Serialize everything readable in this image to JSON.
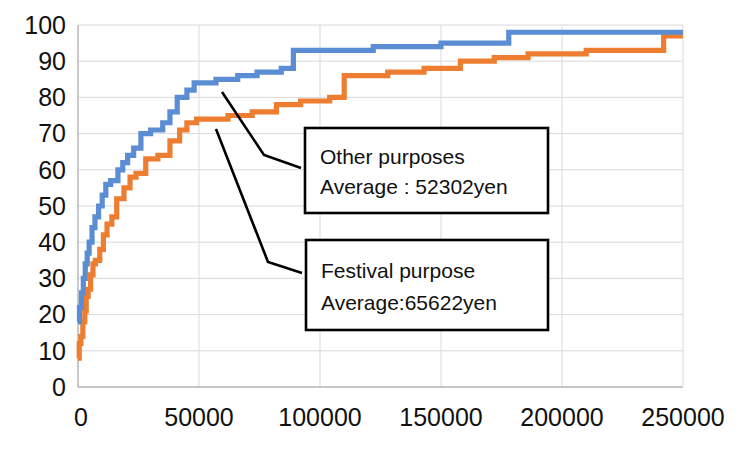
{
  "chart_data": {
    "type": "line",
    "title": "",
    "subtitle": "",
    "xlabel": "",
    "ylabel": "",
    "xlim": [
      0,
      250000
    ],
    "ylim": [
      0,
      100
    ],
    "grid": true,
    "legend_position": "none",
    "x_ticks": [
      "0",
      "50000",
      "100000",
      "150000",
      "200000",
      "250000"
    ],
    "x_tick_values": [
      0,
      50000,
      100000,
      150000,
      200000,
      250000
    ],
    "y_ticks": [
      "0",
      "10",
      "20",
      "30",
      "40",
      "50",
      "60",
      "70",
      "80",
      "90",
      "100"
    ],
    "y_tick_values": [
      0,
      10,
      20,
      30,
      40,
      50,
      60,
      70,
      80,
      90,
      100
    ],
    "series": [
      {
        "name": "Other purposes",
        "color": "#5B8DD4",
        "step": true,
        "points": [
          [
            0,
            18
          ],
          [
            600,
            18
          ],
          [
            600,
            22
          ],
          [
            1400,
            22
          ],
          [
            1400,
            26
          ],
          [
            2200,
            26
          ],
          [
            2200,
            30
          ],
          [
            3000,
            30
          ],
          [
            3000,
            34
          ],
          [
            3800,
            34
          ],
          [
            3800,
            37
          ],
          [
            4600,
            37
          ],
          [
            4600,
            40
          ],
          [
            5800,
            40
          ],
          [
            5800,
            44
          ],
          [
            7000,
            44
          ],
          [
            7000,
            47
          ],
          [
            8500,
            47
          ],
          [
            8500,
            50
          ],
          [
            10000,
            50
          ],
          [
            10000,
            53
          ],
          [
            11500,
            53
          ],
          [
            11500,
            56
          ],
          [
            13500,
            56
          ],
          [
            13500,
            57
          ],
          [
            16500,
            57
          ],
          [
            16500,
            60
          ],
          [
            18500,
            60
          ],
          [
            18500,
            62
          ],
          [
            20500,
            62
          ],
          [
            20500,
            64
          ],
          [
            23000,
            64
          ],
          [
            23000,
            66
          ],
          [
            26000,
            66
          ],
          [
            26000,
            70
          ],
          [
            30000,
            70
          ],
          [
            30000,
            71
          ],
          [
            35000,
            71
          ],
          [
            35000,
            73
          ],
          [
            38000,
            73
          ],
          [
            38000,
            76
          ],
          [
            41000,
            76
          ],
          [
            41000,
            80
          ],
          [
            45000,
            80
          ],
          [
            45000,
            82
          ],
          [
            48000,
            82
          ],
          [
            48000,
            84
          ],
          [
            57000,
            84
          ],
          [
            57000,
            85
          ],
          [
            66000,
            85
          ],
          [
            66000,
            86
          ],
          [
            74000,
            86
          ],
          [
            74000,
            87
          ],
          [
            84000,
            87
          ],
          [
            84000,
            88
          ],
          [
            89000,
            88
          ],
          [
            89000,
            93
          ],
          [
            122000,
            93
          ],
          [
            122000,
            94
          ],
          [
            150000,
            94
          ],
          [
            150000,
            95
          ],
          [
            178000,
            95
          ],
          [
            178000,
            98
          ],
          [
            250000,
            98
          ]
        ]
      },
      {
        "name": "Festival purpose",
        "color": "#ED7D31",
        "step": true,
        "points": [
          [
            0,
            8
          ],
          [
            500,
            8
          ],
          [
            500,
            12
          ],
          [
            1200,
            12
          ],
          [
            1200,
            14
          ],
          [
            2000,
            14
          ],
          [
            2000,
            18
          ],
          [
            2800,
            18
          ],
          [
            2800,
            21
          ],
          [
            3400,
            21
          ],
          [
            3400,
            25
          ],
          [
            4200,
            25
          ],
          [
            4200,
            27
          ],
          [
            5200,
            27
          ],
          [
            5200,
            31
          ],
          [
            6200,
            31
          ],
          [
            6200,
            34
          ],
          [
            7200,
            34
          ],
          [
            7200,
            35
          ],
          [
            9000,
            35
          ],
          [
            9000,
            38
          ],
          [
            10500,
            38
          ],
          [
            10500,
            42
          ],
          [
            12000,
            42
          ],
          [
            12000,
            45
          ],
          [
            14000,
            45
          ],
          [
            14000,
            47
          ],
          [
            16000,
            47
          ],
          [
            16000,
            52
          ],
          [
            19000,
            52
          ],
          [
            19000,
            55
          ],
          [
            21500,
            55
          ],
          [
            21500,
            58
          ],
          [
            24000,
            58
          ],
          [
            24000,
            59
          ],
          [
            28000,
            59
          ],
          [
            28000,
            63
          ],
          [
            33000,
            63
          ],
          [
            33000,
            64
          ],
          [
            38000,
            64
          ],
          [
            38000,
            68
          ],
          [
            42000,
            68
          ],
          [
            42000,
            71
          ],
          [
            45000,
            71
          ],
          [
            45000,
            73
          ],
          [
            49000,
            73
          ],
          [
            49000,
            74
          ],
          [
            62000,
            74
          ],
          [
            62000,
            75
          ],
          [
            72000,
            75
          ],
          [
            72000,
            76
          ],
          [
            82000,
            76
          ],
          [
            82000,
            78
          ],
          [
            92000,
            78
          ],
          [
            92000,
            79
          ],
          [
            104000,
            79
          ],
          [
            104000,
            80
          ],
          [
            110000,
            80
          ],
          [
            110000,
            86
          ],
          [
            128000,
            86
          ],
          [
            128000,
            87
          ],
          [
            143000,
            87
          ],
          [
            143000,
            88
          ],
          [
            158000,
            88
          ],
          [
            158000,
            90
          ],
          [
            172000,
            90
          ],
          [
            172000,
            91
          ],
          [
            186000,
            91
          ],
          [
            186000,
            92
          ],
          [
            210000,
            92
          ],
          [
            210000,
            93
          ],
          [
            242000,
            93
          ],
          [
            242000,
            97
          ],
          [
            250000,
            97
          ]
        ]
      }
    ],
    "annotations": [
      {
        "id": "other-purposes",
        "line1": "Other purposes",
        "line2": "Average : 52302yen",
        "series": "Other purposes",
        "average_yen": 52302
      },
      {
        "id": "festival-purpose",
        "line1": "Festival purpose",
        "line2": "Average:65622yen",
        "series": "Festival purpose",
        "average_yen": 65622
      }
    ]
  },
  "colors": {
    "series_blue": "#5B8DD4",
    "series_orange": "#ED7D31",
    "gridline": "#D9D9D9",
    "axis": "#B3B3B3",
    "text": "#111111",
    "annotation_border": "#000000",
    "background": "#FFFFFF"
  }
}
